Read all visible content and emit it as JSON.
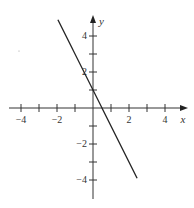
{
  "chart_data": {
    "type": "line",
    "title": "",
    "xlabel": "x",
    "ylabel": "y",
    "xlim": [
      -4.3,
      5
    ],
    "ylim": [
      -5,
      5.1
    ],
    "grid": false,
    "legend": null,
    "x_ticks": [
      -4,
      -3,
      -2,
      -1,
      1,
      2,
      3,
      4
    ],
    "x_tick_labels": [
      "-4",
      "-2",
      "2",
      "4"
    ],
    "y_ticks": [
      -4,
      -3,
      -2,
      -1,
      1,
      2,
      3,
      4
    ],
    "y_tick_labels": [
      "4",
      "2",
      "-2",
      "-4"
    ],
    "series": [
      {
        "name": "y = -2x + 1",
        "equation": "y = -2x + 1",
        "x": [
          -1.95,
          2.45
        ],
        "y": [
          4.9,
          -3.9
        ],
        "color": "#222222"
      }
    ]
  },
  "labels": {
    "x_axis": "x",
    "y_axis": "y",
    "xt_m4": "−4",
    "xt_m2": "−2",
    "xt_2": "2",
    "xt_4": "4",
    "yt_4": "4",
    "yt_2": "2",
    "yt_m2": "−2",
    "yt_m4": "−4"
  },
  "colors": {
    "axis": "#333333",
    "line": "#222222"
  }
}
